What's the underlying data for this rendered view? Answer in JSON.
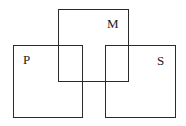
{
  "diagram": {
    "type": "overlapping-squares",
    "sets": [
      {
        "id": "M",
        "label": "M",
        "box": {
          "x": 58,
          "y": 9,
          "w": 71,
          "h": 73
        },
        "label_pos": {
          "x": 107,
          "y": 18
        }
      },
      {
        "id": "P",
        "label": "P",
        "box": {
          "x": 13,
          "y": 45,
          "w": 70,
          "h": 73
        },
        "label_pos": {
          "x": 23,
          "y": 54
        }
      },
      {
        "id": "S",
        "label": "S",
        "box": {
          "x": 105,
          "y": 45,
          "w": 71,
          "h": 73
        },
        "label_pos": {
          "x": 157,
          "y": 55
        }
      }
    ],
    "line_color": "#2a2a2a",
    "background": "#ffffff"
  }
}
